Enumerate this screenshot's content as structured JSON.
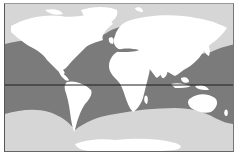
{
  "map": {
    "type": "world-distribution-map",
    "projection": "equirectangular-like",
    "colors": {
      "land": "#ffffff",
      "range_ocean": "#7b7b7b",
      "polar_sea": "#d6d6d6",
      "equator": "#1e1e1e",
      "frame": "#555555"
    },
    "layers": [
      {
        "name": "northern-polar-sea",
        "fill": "light gray"
      },
      {
        "name": "range-band",
        "fill": "dark gray"
      },
      {
        "name": "southern-polar-sea",
        "fill": "light gray"
      },
      {
        "name": "continents",
        "fill": "white"
      },
      {
        "name": "equator-line",
        "fill": "black line"
      }
    ]
  }
}
